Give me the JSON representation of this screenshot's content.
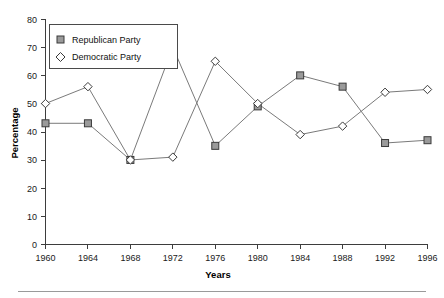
{
  "chart_data": {
    "type": "line",
    "title": "",
    "xlabel": "Years",
    "ylabel": "Percentage",
    "categories": [
      1960,
      1964,
      1968,
      1972,
      1976,
      1980,
      1984,
      1988,
      1992,
      1996
    ],
    "xtick_labels": [
      "1960",
      "1964",
      "1968",
      "1972",
      "1976",
      "1980",
      "1984",
      "1988",
      "1992",
      "1996"
    ],
    "ytick_labels": [
      "0",
      "10",
      "20",
      "30",
      "40",
      "50",
      "60",
      "70",
      "80"
    ],
    "yticks": [
      0,
      10,
      20,
      30,
      40,
      50,
      60,
      70,
      80
    ],
    "ylim": [
      0,
      80
    ],
    "xlim": [
      1960,
      1996
    ],
    "grid": false,
    "legend_position": "top-left",
    "series": [
      {
        "name": "Republican Party",
        "marker": "square",
        "values": [
          43,
          43,
          30,
          70,
          35,
          49,
          60,
          56,
          36,
          37
        ]
      },
      {
        "name": "Democratic Party",
        "marker": "diamond",
        "values": [
          50,
          56,
          30,
          31,
          65,
          50,
          39,
          42,
          54,
          55
        ]
      }
    ]
  },
  "legend": {
    "items": [
      {
        "label": "Republican Party",
        "marker": "square-marker-icon"
      },
      {
        "label": "Democratic Party",
        "marker": "diamond-marker-icon"
      }
    ]
  }
}
